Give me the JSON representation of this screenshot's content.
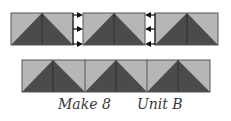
{
  "diagram": {
    "colors": {
      "light": "#b6b6b6",
      "dark": "#4b4b4b",
      "line": "#2e2e2e",
      "arrow": "#111111"
    },
    "top_row": {
      "blocks": [
        {
          "x": 11,
          "y": 13,
          "w": 62,
          "h": 32
        },
        {
          "x": 83,
          "y": 13,
          "w": 62,
          "h": 32
        },
        {
          "x": 155,
          "y": 13,
          "w": 63,
          "h": 32
        }
      ],
      "arrows": [
        {
          "gap_x": [
            73,
            82
          ],
          "direction": "right",
          "y": [
            15,
            29,
            44
          ]
        },
        {
          "gap_x": [
            145,
            155
          ],
          "direction": "left",
          "y": [
            15,
            29,
            44
          ]
        }
      ]
    },
    "bottom_row": {
      "x": 22,
      "y": 60,
      "w": 188,
      "h": 32,
      "blocks": 3
    },
    "captions": {
      "make": "Make 8",
      "unit": "Unit B"
    }
  }
}
